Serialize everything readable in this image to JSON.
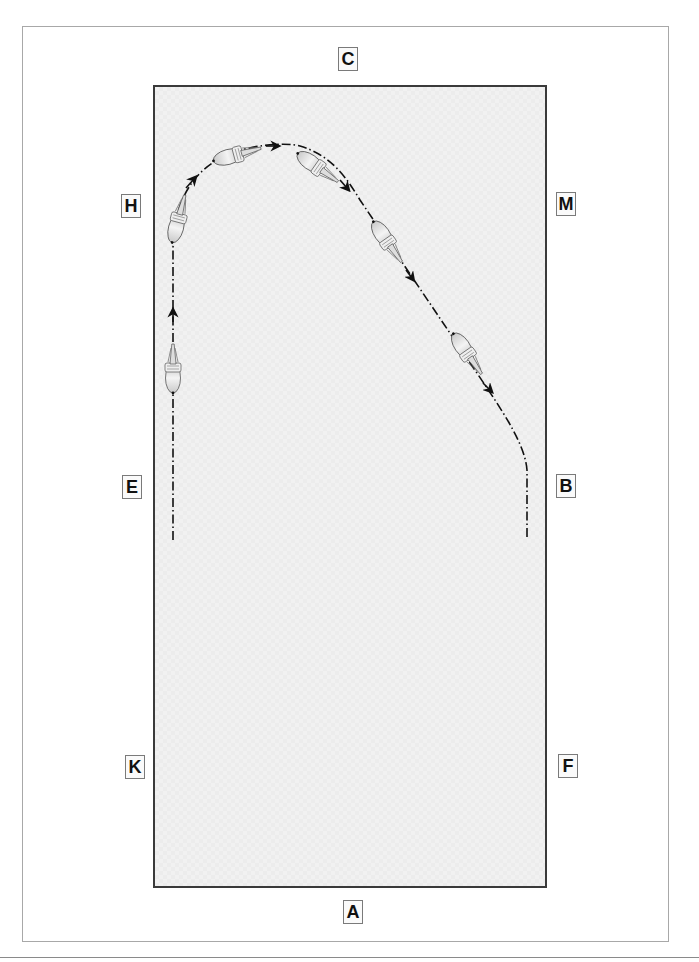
{
  "diagram": {
    "type": "dressage-arena-movement",
    "arena_color": "#f1f1f1",
    "border_color": "#3a3a3a",
    "path_color": "#111111",
    "markers": [
      {
        "letter": "C",
        "position": "top-center"
      },
      {
        "letter": "H",
        "position": "left-upper"
      },
      {
        "letter": "M",
        "position": "right-upper"
      },
      {
        "letter": "E",
        "position": "left-middle"
      },
      {
        "letter": "B",
        "position": "right-middle"
      },
      {
        "letter": "K",
        "position": "left-lower"
      },
      {
        "letter": "F",
        "position": "right-lower"
      },
      {
        "letter": "A",
        "position": "bottom-center"
      }
    ],
    "path": {
      "description": "Rider travels up the left track from E side, turns across the top near H/C, then rides a diagonal line toward B and continues down the right track",
      "line_style": "dash-dot",
      "direction_arrows": 6,
      "horse_figures": 6
    }
  }
}
